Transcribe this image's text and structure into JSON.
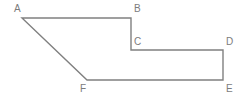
{
  "figure": {
    "name": "hexagon-polygon-abcdef",
    "background_color": "#ffffff",
    "stroke_color": "#808080",
    "stroke_width": 1.4,
    "label_color": "#7c7c7c",
    "label_font_size": 10,
    "closed": true,
    "vertices": [
      {
        "id": "A",
        "label": "A",
        "x": 22,
        "y": 18,
        "label_x": 14,
        "label_y": 4,
        "label_anchor": "above-left"
      },
      {
        "id": "B",
        "label": "B",
        "x": 131,
        "y": 18,
        "label_x": 134,
        "label_y": 4,
        "label_anchor": "above-right"
      },
      {
        "id": "C",
        "label": "C",
        "x": 131,
        "y": 50,
        "label_x": 134,
        "label_y": 37,
        "label_anchor": "above-right"
      },
      {
        "id": "D",
        "label": "D",
        "x": 223,
        "y": 50,
        "label_x": 226,
        "label_y": 37,
        "label_anchor": "above-right"
      },
      {
        "id": "E",
        "label": "E",
        "x": 223,
        "y": 80,
        "label_x": 226,
        "label_y": 84,
        "label_anchor": "below-right"
      },
      {
        "id": "F",
        "label": "F",
        "x": 87,
        "y": 80,
        "label_x": 80,
        "label_y": 84,
        "label_anchor": "below-left"
      }
    ],
    "edges": [
      {
        "from": "A",
        "to": "B",
        "orientation": "horizontal"
      },
      {
        "from": "B",
        "to": "C",
        "orientation": "vertical"
      },
      {
        "from": "C",
        "to": "D",
        "orientation": "horizontal"
      },
      {
        "from": "D",
        "to": "E",
        "orientation": "vertical"
      },
      {
        "from": "E",
        "to": "F",
        "orientation": "horizontal"
      },
      {
        "from": "F",
        "to": "A",
        "orientation": "diagonal"
      }
    ],
    "path": "M 22 18 L 131 18 L 131 50 L 223 50 L 223 80 L 87 80 Z"
  }
}
